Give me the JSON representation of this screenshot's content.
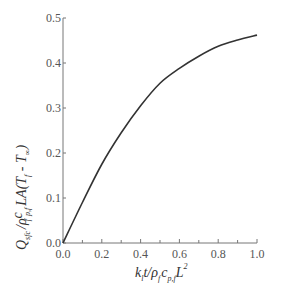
{
  "chart_data": {
    "type": "line",
    "title": "",
    "xlabel": "k_l t / ρ_f c_p,f L²",
    "ylabel": "Q_sfc / ρ_f c_p,f L A (T_f - T_∞)",
    "xlim": [
      0.0,
      1.0
    ],
    "ylim": [
      0.0,
      0.5
    ],
    "x_ticks": [
      "0.0",
      "0.2",
      "0.4",
      "0.6",
      "0.8",
      "1.0"
    ],
    "x_minor_ticks": [
      0.1,
      0.3,
      0.5,
      0.7,
      0.9
    ],
    "y_ticks": [
      "0.0",
      "0.1",
      "0.2",
      "0.3",
      "0.4",
      "0.5"
    ],
    "grid": false,
    "legend": null,
    "series": [
      {
        "name": "Q_sfc",
        "color": "#333333",
        "x": [
          0.0,
          0.1,
          0.2,
          0.3,
          0.4,
          0.5,
          0.6,
          0.7,
          0.8,
          0.9,
          1.0
        ],
        "y": [
          0.0,
          0.09,
          0.175,
          0.245,
          0.305,
          0.355,
          0.388,
          0.415,
          0.437,
          0.451,
          0.462
        ]
      }
    ]
  },
  "labels": {
    "x": {
      "k": "k",
      "k_sub": "l",
      "t": "t/ρ",
      "rho_sub": "f",
      "c": "c",
      "c_sub": "p,f",
      "L": "L",
      "L_sup": "2"
    },
    "y": {
      "Q": "Q",
      "Q_sub": "sfc",
      "slash": "/ρ",
      "rho_sub": "f",
      "c": "c",
      "c_sub": "p,f",
      "LA": "LA(T",
      "T1_sub": "f",
      "minus": " - T",
      "T2_sub": "∞",
      "close": ")"
    }
  }
}
